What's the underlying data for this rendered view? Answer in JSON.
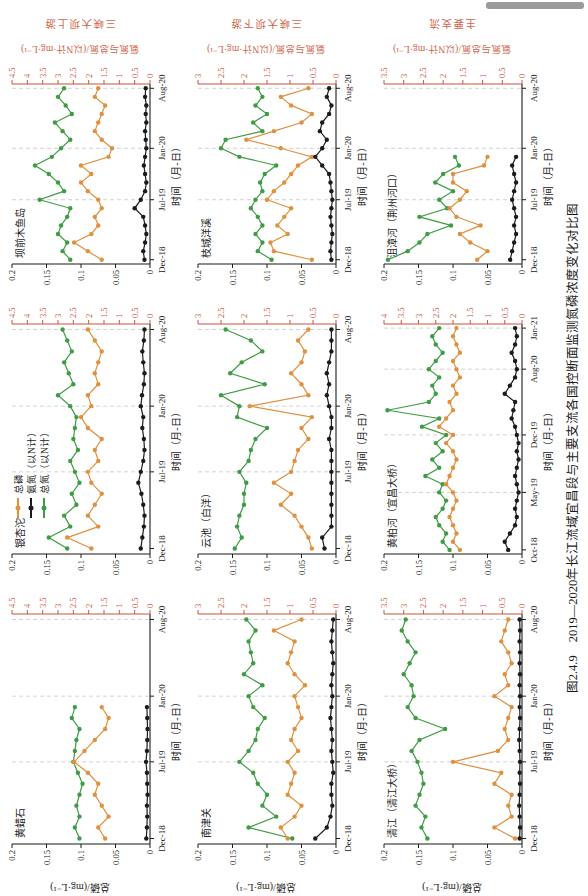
{
  "page": {
    "background": "#ffffff",
    "artifact_bar_color": "#9a9a9a"
  },
  "caption": "图2.4.9　2019—2020年长江流域宜昌段与主要支流各国控断面监测氮磷浓度变化对比图",
  "axes": {
    "left_label": "总磷/(mg·L⁻¹)",
    "right_label": "氨氮与总氮/(以N计·mg·L⁻¹)",
    "x_label": "时间（月-日）",
    "left_ticks": [
      0,
      0.05,
      0.1,
      0.15,
      0.2
    ],
    "left_max": 0.2,
    "grid_color": "#c8c8c8",
    "black_axis_color": "#1a1a1a",
    "red_axis_color": "#c9553d"
  },
  "groups": [
    "三峡大坝上游",
    "三峡大坝下游",
    "主要支流"
  ],
  "series_meta": [
    {
      "key": "tp",
      "label": "总磷",
      "color": "#e0913f",
      "axis": "left"
    },
    {
      "key": "nh3n",
      "label": "氨氮（以N计）",
      "color": "#1b1b1b",
      "axis": "right"
    },
    {
      "key": "tn",
      "label": "总氮（以N计）",
      "color": "#3f9c45",
      "axis": "right"
    }
  ],
  "chart_data": [
    {
      "type": "line",
      "station": "黄蜡石",
      "name": "huanglashi",
      "row": 0,
      "col": 0,
      "group": "三峡大坝上游",
      "red_axis_max": 4.5,
      "black_axis_max": 0.2,
      "axis_months": 21,
      "x_tick_idx": [
        0,
        7,
        13,
        20
      ],
      "x_tick_labels": [
        "Dec-18",
        "Jul-19",
        "Jan-20",
        "Aug-20"
      ],
      "series": {
        "tp": [
          0.065,
          0.075,
          0.06,
          0.07,
          0.08,
          0.075,
          0.09,
          0.11,
          0.095,
          0.08,
          0.065,
          0.06,
          0.07
        ],
        "nh3n": [
          0.12,
          0.1,
          0.09,
          0.1,
          0.08,
          0.09,
          0.1,
          0.13,
          0.1,
          0.09,
          0.08,
          0.09,
          0.1
        ],
        "tn": [
          2.3,
          2.45,
          2.3,
          2.4,
          2.3,
          2.2,
          2.35,
          2.5,
          2.45,
          2.4,
          2.3,
          2.55,
          2.45
        ]
      }
    },
    {
      "type": "line",
      "station": "银杏沱",
      "name": "yinxingtuo",
      "row": 0,
      "col": 1,
      "group": "三峡大坝上游",
      "red_axis_max": 4.5,
      "black_axis_max": 0.2,
      "axis_months": 21,
      "x_tick_idx": [
        0,
        7,
        13,
        20
      ],
      "x_tick_labels": [
        "Dec-18",
        "Jul-19",
        "Jan-20",
        "Aug-20"
      ],
      "series": {
        "tp": [
          0.085,
          0.12,
          0.075,
          0.09,
          0.08,
          0.07,
          0.085,
          0.09,
          0.075,
          0.08,
          0.07,
          0.09,
          0.1,
          0.085,
          0.09,
          0.075,
          0.08,
          0.075,
          0.07,
          0.08,
          0.09
        ],
        "nh3n": [
          0.3,
          0.25,
          0.2,
          0.18,
          0.22,
          0.28,
          0.38,
          0.3,
          0.22,
          0.18,
          0.2,
          0.25,
          0.22,
          0.3,
          0.26,
          0.2,
          0.18,
          0.22,
          0.25,
          0.2,
          0.18
        ],
        "tn": [
          2.7,
          3.3,
          2.6,
          2.8,
          2.4,
          2.55,
          2.3,
          2.45,
          2.6,
          2.35,
          2.5,
          2.45,
          2.4,
          2.6,
          3.0,
          2.5,
          2.65,
          2.8,
          2.55,
          2.7,
          2.85
        ]
      }
    },
    {
      "type": "line",
      "station": "坝前木鱼岛",
      "name": "baqian-muyudao",
      "row": 0,
      "col": 2,
      "group": "三峡大坝上游",
      "red_axis_max": 4.5,
      "black_axis_max": 0.2,
      "axis_months": 21,
      "x_tick_idx": [
        0,
        7,
        13,
        20
      ],
      "x_tick_labels": [
        "Dec-18",
        "Jul-19",
        "Jan-20",
        "Aug-20"
      ],
      "series": {
        "tp": [
          0.07,
          0.09,
          0.11,
          0.085,
          0.075,
          0.08,
          0.07,
          0.075,
          0.09,
          0.1,
          0.085,
          0.1,
          0.06,
          0.055,
          0.07,
          0.08,
          0.075,
          0.07,
          0.065,
          0.08,
          0.075
        ],
        "nh3n": [
          0.18,
          0.22,
          0.16,
          0.12,
          0.16,
          0.22,
          0.5,
          0.3,
          0.16,
          0.12,
          0.16,
          0.2,
          0.16,
          0.12,
          0.14,
          0.16,
          0.12,
          0.14,
          0.12,
          0.16,
          0.14
        ],
        "tn": [
          2.6,
          2.85,
          2.7,
          3.0,
          2.9,
          2.7,
          2.6,
          3.6,
          2.8,
          3.0,
          3.3,
          3.75,
          3.2,
          2.9,
          2.6,
          2.85,
          3.1,
          2.55,
          2.75,
          3.0,
          2.8
        ]
      }
    },
    {
      "type": "line",
      "station": "南津关",
      "name": "nanjinguan",
      "row": 1,
      "col": 0,
      "group": "三峡大坝下游",
      "red_axis_max": 3,
      "black_axis_max": 0.2,
      "axis_months": 21,
      "x_tick_idx": [
        0,
        7,
        13,
        20
      ],
      "x_tick_labels": [
        "Dec-18",
        "Jul-19",
        "Jan-20",
        "Aug-20"
      ],
      "series": {
        "tp": [
          0.07,
          0.08,
          0.06,
          0.05,
          0.07,
          0.065,
          0.06,
          0.07,
          0.055,
          0.065,
          0.06,
          0.05,
          0.055,
          0.06,
          0.045,
          0.06,
          0.07,
          0.065,
          0.06,
          0.09,
          0.05
        ],
        "nh3n": [
          0.45,
          0.2,
          0.12,
          0.08,
          0.1,
          0.1,
          0.06,
          0.08,
          0.1,
          0.08,
          0.1,
          0.12,
          0.1,
          0.08,
          0.1,
          0.08,
          0.06,
          0.08,
          0.1,
          0.08,
          0.06
        ],
        "tn": [
          0.95,
          1.9,
          1.3,
          1.6,
          1.5,
          1.7,
          1.8,
          2.1,
          1.9,
          1.75,
          1.7,
          1.55,
          1.8,
          1.9,
          1.6,
          2.0,
          1.8,
          1.85,
          1.9,
          1.75,
          1.95
        ]
      }
    },
    {
      "type": "line",
      "station": "云池（白洋）",
      "name": "yunchi-baiyang",
      "row": 1,
      "col": 1,
      "group": "三峡大坝下游",
      "red_axis_max": 3,
      "black_axis_max": 0.2,
      "axis_months": 21,
      "x_tick_idx": [
        0,
        7,
        13,
        20
      ],
      "x_tick_labels": [
        "Dec-18",
        "Jul-19",
        "Jan-20",
        "Aug-20"
      ],
      "series": {
        "tp": [
          0.035,
          0.04,
          0.05,
          0.06,
          0.08,
          0.065,
          0.09,
          0.065,
          0.06,
          0.055,
          0.04,
          0.05,
          0.035,
          0.125,
          0.04,
          0.05,
          0.065,
          0.05,
          0.045,
          0.055,
          0.04
        ],
        "nh3n": [
          0.25,
          0.3,
          0.1,
          0.1,
          0.1,
          0.1,
          0.1,
          0.1,
          0.1,
          0.1,
          0.15,
          0.1,
          0.1,
          0.15,
          0.2,
          0.15,
          0.2,
          0.15,
          0.1,
          0.1,
          0.1
        ],
        "tn": [
          2.2,
          2.05,
          2.15,
          2.1,
          2.0,
          2.0,
          1.95,
          2.1,
          1.9,
          1.85,
          1.75,
          1.5,
          2.15,
          2.1,
          2.5,
          1.55,
          2.3,
          2.05,
          1.6,
          1.85,
          2.4
        ]
      }
    },
    {
      "type": "line",
      "station": "枝城洋溪",
      "name": "zhicheng-yangxi",
      "row": 1,
      "col": 2,
      "group": "三峡大坝下游",
      "red_axis_max": 3,
      "black_axis_max": 0.2,
      "axis_months": 21,
      "x_tick_idx": [
        0,
        7,
        13,
        20
      ],
      "x_tick_labels": [
        "Dec-18",
        "Jul-19",
        "Jan-20",
        "Aug-20"
      ],
      "series": {
        "tp": [
          0.035,
          0.09,
          0.095,
          0.07,
          0.085,
          0.075,
          0.065,
          0.1,
          0.09,
          0.075,
          0.065,
          0.055,
          0.035,
          0.08,
          0.13,
          0.09,
          0.05,
          0.035,
          0.065,
          0.08,
          0.04
        ],
        "nh3n": [
          0.1,
          0.12,
          0.1,
          0.08,
          0.1,
          0.12,
          0.1,
          0.08,
          0.1,
          0.12,
          0.15,
          0.3,
          0.45,
          0.3,
          0.2,
          0.35,
          0.3,
          0.15,
          0.1,
          0.2,
          0.15
        ],
        "tn": [
          1.4,
          1.7,
          1.6,
          1.75,
          1.6,
          1.7,
          1.85,
          1.75,
          1.6,
          1.65,
          1.55,
          1.3,
          2.1,
          2.5,
          2.4,
          1.6,
          1.8,
          1.5,
          1.75,
          1.6,
          1.7
        ]
      }
    },
    {
      "type": "line",
      "station": "清江（清江大桥）",
      "name": "qingjiang-bridge",
      "row": 2,
      "col": 0,
      "group": "主要支流",
      "red_axis_max": 3.5,
      "black_axis_max": 0.2,
      "axis_months": 21,
      "x_tick_idx": [
        0,
        7,
        13,
        20
      ],
      "x_tick_labels": [
        "Dec-18",
        "Jul-19",
        "Jan-20",
        "Aug-20"
      ],
      "series": {
        "tp": [
          0.01,
          0.04,
          0.015,
          0.02,
          0.015,
          0.04,
          0.03,
          0.1,
          0.035,
          0.02,
          0.025,
          0.02,
          0.015,
          0.04,
          0.02,
          0.025,
          0.015,
          0.02,
          0.03,
          0.025,
          0.02
        ],
        "nh3n": [
          0.06,
          0.05,
          0.06,
          0.07,
          0.06,
          0.05,
          0.06,
          0.05,
          0.06,
          0.07,
          0.06,
          0.05,
          0.06,
          0.05,
          0.06,
          0.05,
          0.06,
          0.05,
          0.06,
          0.05,
          0.06
        ],
        "tn": [
          2.4,
          2.55,
          2.45,
          2.7,
          2.6,
          2.5,
          2.55,
          2.65,
          2.8,
          2.6,
          1.95,
          2.7,
          2.9,
          2.75,
          2.8,
          3.0,
          2.85,
          2.7,
          2.9,
          3.05,
          2.95
        ]
      }
    },
    {
      "type": "line",
      "station": "黄柏河（宜昌大桥）",
      "name": "huangbaihe-yichang",
      "row": 2,
      "col": 1,
      "group": "主要支流",
      "red_axis_max": 4,
      "black_axis_max": 0.2,
      "axis_months": 28,
      "x_tick_idx": [
        0,
        7,
        14,
        22,
        27
      ],
      "x_tick_labels": [
        "Oct-18",
        "May-19",
        "Dec-19",
        "Aug-20",
        "Jan-21"
      ],
      "series": {
        "tp": [
          0.09,
          0.1,
          0.095,
          0.1,
          0.105,
          0.1,
          0.095,
          0.1,
          0.11,
          0.105,
          0.1,
          0.095,
          0.1,
          0.11,
          0.1,
          0.12,
          0.11,
          0.1,
          0.105,
          0.095,
          0.1,
          0.09,
          0.095,
          0.1,
          0.09,
          0.095,
          0.1,
          0.095
        ],
        "nh3n": [
          0.4,
          0.5,
          0.35,
          0.2,
          0.15,
          0.2,
          0.15,
          0.1,
          0.15,
          0.2,
          0.15,
          0.1,
          0.15,
          0.1,
          0.15,
          0.2,
          0.3,
          0.25,
          0.2,
          0.5,
          0.35,
          0.2,
          0.15,
          0.2,
          0.3,
          0.2,
          0.15,
          0.2
        ],
        "tn": [
          2.1,
          2.3,
          2.2,
          2.4,
          2.5,
          2.3,
          2.2,
          2.4,
          2.3,
          2.8,
          2.4,
          2.6,
          2.3,
          2.5,
          2.2,
          2.9,
          2.4,
          3.9,
          2.7,
          2.5,
          2.6,
          2.4,
          2.7,
          2.5,
          2.3,
          2.5,
          2.6,
          2.4
        ]
      }
    },
    {
      "type": "line",
      "station": "沮漳河（荆州河口）",
      "name": "juzhanghe-jingzhou",
      "row": 2,
      "col": 2,
      "group": "主要支流",
      "red_axis_max": 3.5,
      "black_axis_max": 0.2,
      "axis_months": 21,
      "x_tick_idx": [
        0,
        7,
        13,
        20
      ],
      "x_tick_labels": [
        "Dec-18",
        "Jul-19",
        "Jan-20",
        "Aug-20"
      ],
      "series": {
        "tp": [
          0.065,
          0.05,
          0.075,
          0.09,
          0.06,
          0.095,
          0.105,
          0.09,
          0.08,
          0.1,
          0.1,
          0.055,
          0.05
        ],
        "nh3n": [
          0.3,
          0.25,
          0.2,
          0.15,
          0.2,
          0.15,
          0.2,
          0.25,
          0.2,
          0.15,
          0.2,
          0.25,
          0.15
        ],
        "tn": [
          3.4,
          2.9,
          2.6,
          2.4,
          1.8,
          2.6,
          1.9,
          2.1,
          1.75,
          2.2,
          2.0,
          1.6,
          1.7
        ]
      }
    }
  ]
}
